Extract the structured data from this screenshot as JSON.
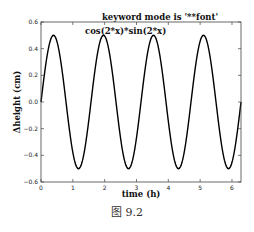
{
  "caption": "图 9.2",
  "chart_data": {
    "type": "line",
    "title": "keyword mode is '**font'",
    "annotation": "cos(2*x)*sin(2*x)",
    "xlabel": "time (h)",
    "ylabel": "Δheight (cm)",
    "xlim": [
      0,
      6.2832
    ],
    "ylim": [
      -0.6,
      0.6
    ],
    "xticks": [
      0,
      1,
      2,
      3,
      4,
      5,
      6
    ],
    "xtick_labels": [
      "0",
      "1",
      "2",
      "3",
      "4",
      "5",
      "6"
    ],
    "yticks": [
      -0.6,
      -0.4,
      -0.2,
      0.0,
      0.2,
      0.4,
      0.6
    ],
    "ytick_labels": [
      "−0.6",
      "−0.4",
      "−0.2",
      "0.0",
      "0.2",
      "0.4",
      "0.6"
    ],
    "grid": false,
    "legend": null,
    "series": [
      {
        "name": "cos(2*x)*sin(2*x)",
        "formula": "0.5*sin(4*x)",
        "color": "#000000",
        "x": [
          0,
          0.393,
          0.785,
          1.178,
          1.571,
          1.963,
          2.356,
          2.749,
          3.142,
          3.534,
          3.927,
          4.32,
          4.712,
          5.105,
          5.498,
          5.89,
          6.283
        ],
        "y": [
          0,
          0.5,
          0,
          -0.5,
          0,
          0.5,
          0,
          -0.5,
          0,
          0.5,
          0,
          -0.5,
          0,
          0.5,
          0,
          -0.5,
          0
        ]
      }
    ]
  },
  "layout": {
    "plot_left": 41,
    "plot_top": 22,
    "plot_right": 241,
    "plot_bottom": 182
  }
}
